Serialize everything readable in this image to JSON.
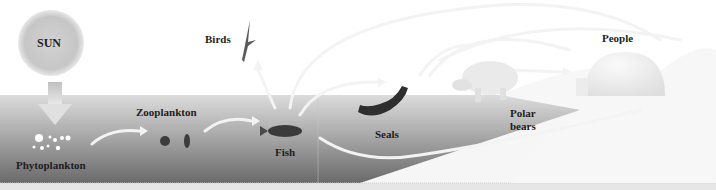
{
  "diagram": {
    "type": "arctic-food-chain",
    "nodes": [
      {
        "id": "sun",
        "label": "SUN"
      },
      {
        "id": "phytoplankton",
        "label": "Phytoplankton"
      },
      {
        "id": "zooplankton",
        "label": "Zooplankton"
      },
      {
        "id": "fish",
        "label": "Fish"
      },
      {
        "id": "birds",
        "label": "Birds"
      },
      {
        "id": "seals",
        "label": "Seals"
      },
      {
        "id": "polar_bears",
        "label_line1": "Polar",
        "label_line2": "bears"
      },
      {
        "id": "people",
        "label": "People"
      }
    ],
    "edges": [
      [
        "sun",
        "phytoplankton"
      ],
      [
        "phytoplankton",
        "zooplankton"
      ],
      [
        "zooplankton",
        "fish"
      ],
      [
        "fish",
        "birds"
      ],
      [
        "fish",
        "seals"
      ],
      [
        "fish",
        "polar_bears"
      ],
      [
        "fish",
        "people"
      ],
      [
        "seals",
        "polar_bears"
      ],
      [
        "seals",
        "people"
      ],
      [
        "polar_bears",
        "people"
      ]
    ],
    "colors": {
      "water_top": "#d8d8d8",
      "water_bottom": "#6e6e6e",
      "sun": "#c9c9c9",
      "ice": "#f4f4f4",
      "arrow": "#efefef",
      "label": "#1e1e1e"
    }
  }
}
